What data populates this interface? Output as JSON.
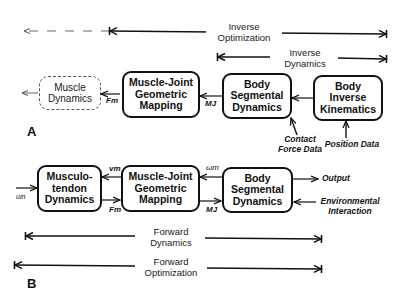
{
  "panel_a": {
    "label": "A",
    "spans": {
      "inverse_optimization": {
        "line1": "Inverse",
        "line2": "Optimization"
      },
      "inverse_dynamics": {
        "line1": "Inverse",
        "line2": "Dynamics"
      }
    },
    "boxes": {
      "muscle_dynamics": {
        "line1": "Muscle",
        "line2": "Dynamics"
      },
      "muscle_joint": {
        "line1": "Muscle-Joint",
        "line2": "Geometric",
        "line3": "Mapping"
      },
      "body_segmental": {
        "line1": "Body",
        "line2": "Segmental",
        "line3": "Dynamics"
      },
      "body_inverse_kinematics": {
        "line1": "Body",
        "line2": "Inverse",
        "line3": "Kinematics"
      }
    },
    "signals": {
      "fm": "Fm",
      "mj": "MJ"
    },
    "inputs": {
      "contact_force": {
        "line1": "Contact",
        "line2": "Force Data"
      },
      "position": "Position Data"
    }
  },
  "panel_b": {
    "label": "B",
    "boxes": {
      "musculotendon": {
        "line1": "Musculo-",
        "line2": "tendon",
        "line3": "Dynamics"
      },
      "muscle_joint": {
        "line1": "Muscle-Joint",
        "line2": "Geometric",
        "line3": "Mapping"
      },
      "body_segmental": {
        "line1": "Body",
        "line2": "Segmental",
        "line3": "Dynamics"
      }
    },
    "signals": {
      "uin": "uin",
      "vm": "vm",
      "fm": "Fm",
      "omega": "ωm",
      "mj": "MJ"
    },
    "outputs": {
      "output": "Output",
      "environment": {
        "line1": "Environmental",
        "line2": "Interaction"
      }
    },
    "spans": {
      "forward_dynamics": {
        "line1": "Forward",
        "line2": "Dynamics"
      },
      "forward_optimization": {
        "line1": "Forward",
        "line2": "Optimization"
      }
    }
  }
}
